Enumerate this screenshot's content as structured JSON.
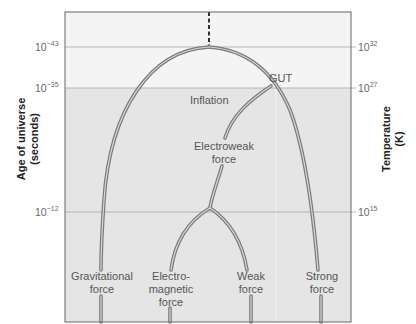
{
  "left_axis": {
    "title_line1": "Age of universe",
    "title_line2": "(seconds)",
    "ticks": [
      {
        "base": "10",
        "exp": "−43"
      },
      {
        "base": "10",
        "exp": "−35"
      },
      {
        "base": "10",
        "exp": "−12"
      }
    ]
  },
  "right_axis": {
    "title_line1": "Temperature",
    "title_line2": "(K)",
    "ticks": [
      {
        "base": "10",
        "exp": "32"
      },
      {
        "base": "10",
        "exp": "27"
      },
      {
        "base": "10",
        "exp": "15"
      }
    ]
  },
  "labels": {
    "gut": "GUT",
    "inflation": "Inflation",
    "electroweak_line1": "Electroweak",
    "electroweak_line2": "force",
    "gravitational_line1": "Gravitational",
    "gravitational_line2": "force",
    "em_line1": "Electro-",
    "em_line2": "magnetic",
    "em_line3": "force",
    "weak_line1": "Weak",
    "weak_line2": "force",
    "strong_line1": "Strong",
    "strong_line2": "force"
  },
  "colors": {
    "top_band": "#f4f4f4",
    "lower_band": "#e5e5e5",
    "line_outer": "#7a7a7a",
    "line_inner": "#d8d8d8",
    "frame": "#666666",
    "gridline": "#a8a8a8"
  }
}
